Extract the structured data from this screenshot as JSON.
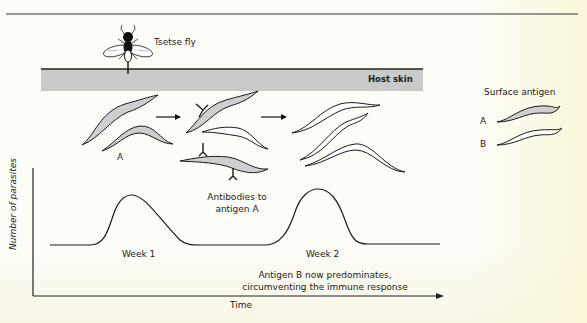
{
  "figure": {
    "title_top_rule": true,
    "labels": {
      "tsetse_fly": "Tsetse fly",
      "host_skin": "Host skin",
      "surface_antigen": "Surface antigen",
      "legend_a": "A",
      "legend_b": "B",
      "parasite_group_a": "A",
      "antibodies_line1": "Antibodies to",
      "antibodies_line2": "antigen A",
      "week1": "Week 1",
      "week2": "Week 2",
      "outcome_line1": "Antigen B now predominates,",
      "outcome_line2": "circumventing the immune response",
      "x_axis": "Time",
      "y_axis": "Number of parasites"
    },
    "colors": {
      "ink": "#1a1a1a",
      "skin_fill": "#c9c9c9",
      "antigen_a_fill": "#cfcfcf",
      "antigen_b_fill": "#ffffff",
      "paper": "#fdfdf8"
    },
    "stages": [
      {
        "name": "initial infection",
        "antigen": "A",
        "parasites": 2
      },
      {
        "name": "antibody response",
        "antigen": "A bound by antibodies",
        "parasites": 3
      },
      {
        "name": "antigenic variation",
        "antigen": "B",
        "parasites": 4
      }
    ],
    "curve": {
      "peaks": [
        {
          "label": "Week 1",
          "relative_height": 1.0
        },
        {
          "label": "Week 2",
          "relative_height": 1.0
        }
      ]
    }
  }
}
